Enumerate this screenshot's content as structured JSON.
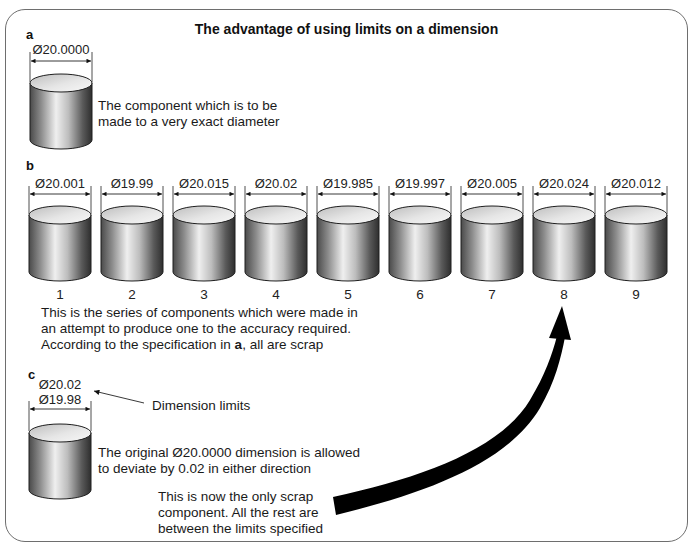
{
  "title": "The advantage of using limits on a dimension",
  "panel_a": {
    "label": "a",
    "dimension": "Ø20.0000",
    "description_line1": "The component which is to be",
    "description_line2": "made to a very exact diameter"
  },
  "panel_b": {
    "label": "b",
    "components": [
      {
        "number": "1",
        "dimension": "Ø20.001"
      },
      {
        "number": "2",
        "dimension": "Ø19.99"
      },
      {
        "number": "3",
        "dimension": "Ø20.015"
      },
      {
        "number": "4",
        "dimension": "Ø20.02"
      },
      {
        "number": "5",
        "dimension": "Ø19.985"
      },
      {
        "number": "6",
        "dimension": "Ø19.997"
      },
      {
        "number": "7",
        "dimension": "Ø20.005"
      },
      {
        "number": "8",
        "dimension": "Ø20.024"
      },
      {
        "number": "9",
        "dimension": "Ø20.012"
      }
    ],
    "description_line1": "This is the series of components which were made in",
    "description_line2": "an attempt to produce one to the accuracy required.",
    "description_line3_pre": "According to the specification in ",
    "description_line3_bold": "a",
    "description_line3_post": ", all are scrap"
  },
  "panel_c": {
    "label": "c",
    "upper_limit": "Ø20.02",
    "lower_limit": "Ø19.98",
    "limits_callout": "Dimension limits",
    "description_line1": "The original Ø20.0000 dimension is allowed",
    "description_line2": "to deviate by 0.02 in either direction",
    "scrap_note_line1": "This is now the only scrap",
    "scrap_note_line2": "component.  All the rest are",
    "scrap_note_line3": "between the limits specified"
  },
  "colors": {
    "frame": "#6e6e6e",
    "cylinder_dark": "#3a3a3a",
    "cylinder_light": "#f2f2f2",
    "arrow": "#000000"
  }
}
